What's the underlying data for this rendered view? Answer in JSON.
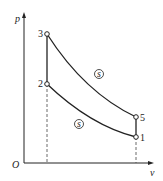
{
  "diagram": {
    "axes": {
      "y_label": "p",
      "x_label": "v",
      "origin_label": "O"
    },
    "points": [
      {
        "id": "3",
        "label": "3",
        "x": 47,
        "y": 34
      },
      {
        "id": "2",
        "label": "2",
        "x": 47,
        "y": 84
      },
      {
        "id": "5",
        "label": "5",
        "x": 136,
        "y": 117
      },
      {
        "id": "1",
        "label": "1",
        "x": 136,
        "y": 137
      }
    ],
    "curves": [
      {
        "from": "3",
        "to": "5",
        "type": "isentropic",
        "marker": "s"
      },
      {
        "from": "2",
        "to": "1",
        "type": "isentropic",
        "marker": "s"
      },
      {
        "from": "2",
        "to": "3",
        "type": "isochoric"
      },
      {
        "from": "1",
        "to": "5",
        "type": "isochoric"
      }
    ],
    "markers": {
      "upper": "s",
      "lower": "s"
    },
    "colors": {
      "line": "#222222",
      "background": "#ffffff"
    }
  }
}
